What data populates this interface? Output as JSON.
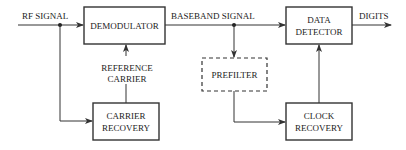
{
  "diagram": {
    "title": "",
    "blocks": {
      "demodulator": {
        "label": "DEMODULATOR"
      },
      "data_detector": {
        "line1": "DATA",
        "line2": "DETECTOR"
      },
      "prefilter": {
        "label": "PREFILTER",
        "style": "dashed"
      },
      "carrier_recovery": {
        "line1": "CARRIER",
        "line2": "RECOVERY"
      },
      "clock_recovery": {
        "line1": "CLOCK",
        "line2": "RECOVERY"
      }
    },
    "signals": {
      "rf_signal": "RF SIGNAL",
      "baseband_signal": "BASEBAND SIGNAL",
      "digits": "DIGITS",
      "reference_carrier_line1": "REFERENCE",
      "reference_carrier_line2": "CARRIER"
    },
    "colors": {
      "stroke": "#333333",
      "text": "#222222",
      "background": "#ffffff"
    }
  }
}
